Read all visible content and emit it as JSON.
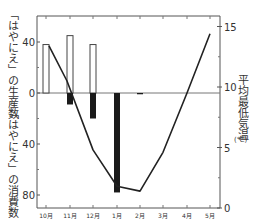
{
  "chart_data": {
    "type": "bar+line",
    "title": "",
    "categories": [
      "10月",
      "11月",
      "12月",
      "1月",
      "2月",
      "3月",
      "4月",
      "5月"
    ],
    "series": [
      {
        "name": "「はやにえ」の生産数",
        "type": "bar",
        "style": "white-outline",
        "axis": "left-up",
        "values": [
          38,
          45,
          38,
          0,
          0,
          0,
          0,
          0
        ]
      },
      {
        "name": "「はやにえ」の消費数",
        "type": "bar",
        "style": "black",
        "axis": "left-down",
        "values": [
          0,
          9,
          20,
          78,
          1,
          0,
          0,
          0
        ]
      },
      {
        "name": "平均最低気温",
        "type": "line",
        "axis": "right",
        "values": [
          13.4,
          10.5,
          4.8,
          1.8,
          1.4,
          4.6,
          9.5,
          14.4
        ]
      }
    ],
    "left_axis": {
      "upper_label": "「はやにえ」の生産数",
      "lower_label": "「はやにえ」の消費数",
      "ticks": [
        "40",
        "0",
        "40",
        "80"
      ],
      "range_upper": [
        0,
        60
      ],
      "range_lower": [
        0,
        90
      ]
    },
    "right_axis": {
      "label": "平均最低気温",
      "unit": "(℃)",
      "ticks": [
        "15",
        "10",
        "5",
        "0"
      ],
      "range": [
        0,
        16
      ]
    },
    "xlabel": "",
    "grid": false,
    "legend": "none"
  },
  "labels": {
    "left_upper": "「はやにえ」の生産数",
    "left_lower": "「はやにえ」の消費数",
    "right": "平均最低気温",
    "right_unit": "(℃)"
  }
}
